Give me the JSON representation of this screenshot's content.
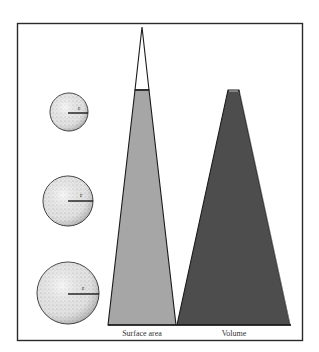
{
  "figure": {
    "colors": {
      "frame": "#2a2a2a",
      "background": "#ffffff",
      "surface_area_fill": "#a6a6a6",
      "volume_fill": "#4d4d4d",
      "sphere_fill": "#e8e8e8",
      "stroke": "#1a1a1a"
    },
    "spheres": [
      {
        "label": "r",
        "cx": 69,
        "cy": 112,
        "radius": 19
      },
      {
        "label": "r",
        "cx": 68,
        "cy": 201,
        "radius": 25
      },
      {
        "label": "r",
        "cx": 68,
        "cy": 293,
        "radius": 31
      }
    ],
    "bars": [
      {
        "label": "Surface area"
      },
      {
        "label": "Volume"
      }
    ]
  }
}
